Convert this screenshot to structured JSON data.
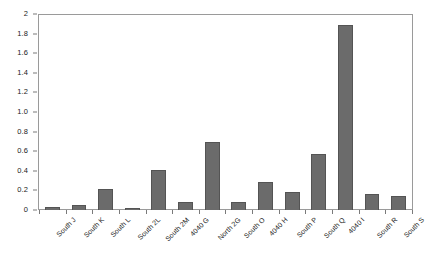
{
  "chart_data": {
    "type": "bar",
    "title": "",
    "xlabel": "",
    "ylabel": "",
    "ylim": [
      0,
      2
    ],
    "ytick_step": 0.2,
    "grid": false,
    "legend": false,
    "bar_color": "#6b6b6b",
    "bar_border_color": "#545454",
    "axis_color": "#9a9a9a",
    "ytick_labels": [
      "2",
      "1.8",
      "1.6",
      "1.4",
      "1.2",
      "1.0",
      "0.8",
      "0.6",
      "0.4",
      "0.2",
      "0"
    ],
    "ytick_values": [
      2,
      1.8,
      1.6,
      1.4,
      1.2,
      1.0,
      0.8,
      0.6,
      0.4,
      0.2,
      0
    ],
    "categories": [
      "South J",
      "South K",
      "South L",
      "South 2L",
      "South 2M",
      "4040 G",
      "North 2G",
      "South O",
      "4040 H",
      "South P",
      "South Q",
      "4040 I",
      "South R",
      "South S"
    ],
    "values": [
      0.03,
      0.05,
      0.215,
      0.025,
      0.41,
      0.085,
      0.69,
      0.085,
      0.29,
      0.18,
      0.57,
      1.885,
      0.16,
      0.14
    ]
  }
}
